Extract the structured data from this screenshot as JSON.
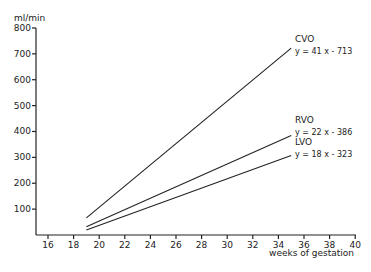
{
  "chart_data": {
    "type": "line",
    "title": "",
    "xlabel": "weeks of gestation",
    "ylabel": "ml/min",
    "xlim": [
      15,
      40
    ],
    "ylim": [
      0,
      800
    ],
    "x_ticks": [
      "16",
      "18",
      "20",
      "22",
      "24",
      "26",
      "28",
      "30",
      "32",
      "34",
      "36",
      "38",
      "40"
    ],
    "y_ticks": [
      "100",
      "200",
      "300",
      "400",
      "500",
      "600",
      "700",
      "800"
    ],
    "grid": false,
    "series": [
      {
        "name": "CVO",
        "equation": "y = 41 x - 713",
        "x": [
          19,
          35
        ],
        "values": [
          66,
          722
        ]
      },
      {
        "name": "RVO",
        "equation": "y = 22 x - 386",
        "x": [
          19,
          35
        ],
        "values": [
          32,
          384
        ]
      },
      {
        "name": "LVO",
        "equation": "y = 18 x - 323",
        "x": [
          19,
          35
        ],
        "values": [
          19,
          307
        ]
      }
    ]
  }
}
